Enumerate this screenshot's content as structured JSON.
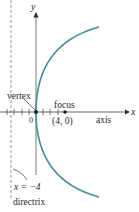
{
  "diagram": {
    "type": "parabola",
    "equation_implied": "y^2 = 16x",
    "axes": {
      "x_label": "x",
      "y_label": "y",
      "origin_label": "0"
    },
    "labels": {
      "vertex": "vertex",
      "focus": "focus",
      "focus_coords": "(4, 0)",
      "axis": "axis",
      "directrix_eq": "x = −4",
      "directrix": "directrix"
    },
    "points": {
      "vertex": [
        0,
        0
      ],
      "focus": [
        4,
        0
      ]
    },
    "directrix_x": -4,
    "colors": {
      "curve": "#3a8fa0",
      "axes": "#555555",
      "text": "#2a2a2a",
      "directrix": "#888888"
    }
  }
}
